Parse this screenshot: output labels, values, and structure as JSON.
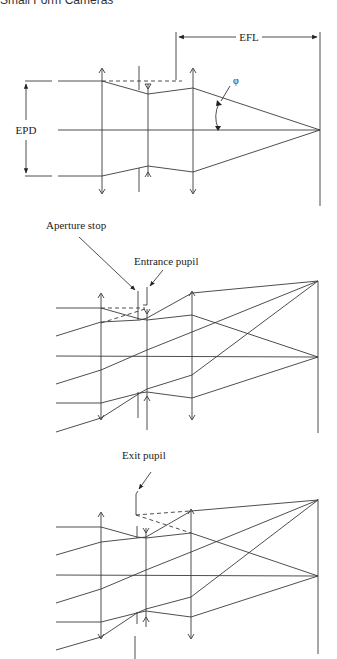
{
  "running_header": "Small Form Cameras",
  "figures": [
    {
      "id": "efl-epd",
      "labels": {
        "efl": "EFL",
        "epd": "EPD",
        "angle": "φ"
      }
    },
    {
      "id": "entrance-pupil",
      "labels": {
        "aperture_stop": "Aperture stop",
        "entrance_pupil": "Entrance pupil"
      }
    },
    {
      "id": "exit-pupil",
      "labels": {
        "exit_pupil": "Exit pupil"
      }
    }
  ],
  "colors": {
    "line": "#3a3a3a",
    "text": "#222222",
    "background": "#ffffff"
  }
}
